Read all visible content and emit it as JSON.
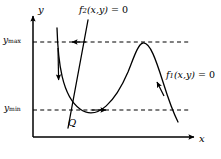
{
  "figure": {
    "kind": "phase-plane-nullcline-diagram",
    "background_color": "#ffffff",
    "stroke_color": "#000000",
    "width": 221,
    "height": 159,
    "axes": {
      "x_label": "x",
      "y_label": "y",
      "x_axis_y": 137,
      "y_axis_x": 33,
      "x_axis_end": 196,
      "y_axis_top": 14
    },
    "tick_labels": {
      "y_max": {
        "base": "y",
        "sub": "max",
        "y": 42
      },
      "y_min": {
        "base": "y",
        "sub": "min",
        "y": 110
      }
    },
    "curve_labels": {
      "f1": {
        "base": "f",
        "sub": "1",
        "args": "(x,y)",
        "eq": " = 0"
      },
      "f2": {
        "base": "f",
        "sub": "2",
        "args": "(x,y)",
        "eq": " = 0"
      }
    },
    "point_labels": {
      "Q": "Q"
    },
    "guides": [
      {
        "name": "y-max-dashed-line",
        "y": 42,
        "x_start": 33,
        "x_end": 190,
        "arrow": "left",
        "arrow_x": 75
      },
      {
        "name": "y-min-dashed-line",
        "y": 110,
        "x_start": 33,
        "x_end": 190,
        "arrow": "right",
        "arrow_x": 105
      }
    ],
    "curves": {
      "f1_nullcline": {
        "name": "f1-curve",
        "path": "M 57,28 C 58,62 62,96 80,109 C 98,122 116,100 128,72 C 134,57 138,44 143,43 C 150,42 156,60 163,82 C 168,98 174,114 178,122",
        "arrows": [
          {
            "name": "f1-down-arrow",
            "x": 58,
            "y": 78,
            "dir": "down"
          },
          {
            "name": "f1-up-left-arrow",
            "x": 158,
            "y": 88,
            "dir": "up-left"
          }
        ]
      },
      "f2_nullcline": {
        "name": "f2-line",
        "path": "M 88,20 L 68,128"
      }
    },
    "intersection": {
      "name": "point-Q",
      "x": 76,
      "y": 110
    }
  }
}
